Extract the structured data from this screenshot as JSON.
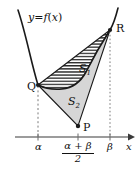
{
  "figure": {
    "curve_label": "y = f(x)",
    "curve_label_parts": {
      "y": "y",
      "equals": "=",
      "f": "f",
      "open": "(",
      "x": "x",
      "close": ")"
    },
    "points": [
      {
        "id": "Q",
        "label": "Q",
        "x": 38,
        "y": 85
      },
      {
        "id": "R",
        "label": "R",
        "x": 110,
        "y": 30
      },
      {
        "id": "P",
        "label": "P",
        "x": 78,
        "y": 126
      }
    ],
    "regions": [
      {
        "id": "S1",
        "label": "S",
        "subscript": "1",
        "fill": "hatched",
        "color": "#ffffff"
      },
      {
        "id": "S2",
        "label": "S",
        "subscript": "2",
        "fill": "solid",
        "color": "#d6d6d6"
      }
    ],
    "axis": {
      "name": "x-axis",
      "label": "x",
      "ticks": [
        {
          "id": "alpha",
          "label": "α",
          "x": 38
        },
        {
          "id": "midpoint",
          "label": "(α + β)/2",
          "numerator": "α + β",
          "denominator": "2",
          "x": 78
        },
        {
          "id": "beta",
          "label": "β",
          "x": 110
        }
      ]
    },
    "colors": {
      "stroke": "#1a1a1a",
      "hatch": "#2b2b2b",
      "region_fill": "#d6d6d6",
      "guide": "#7a7a7a",
      "background": "#ffffff"
    }
  }
}
